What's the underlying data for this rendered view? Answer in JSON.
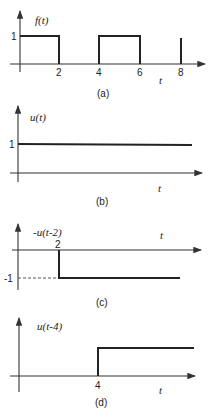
{
  "panels": [
    {
      "id": "a",
      "caption": "(a)",
      "ylabel": "f(t)",
      "xlabel": "t",
      "ytick": "1",
      "xticks": [
        "2",
        "4",
        "6",
        "8"
      ],
      "description": "Rectangular pulses of height 1 from t=0 to 2 and t=4 to 6, plus a vertical line at t=8"
    },
    {
      "id": "b",
      "caption": "(b)",
      "ylabel": "u(t)",
      "xlabel": "t",
      "ytick": "1",
      "description": "Unit step: constant 1 for t>=0"
    },
    {
      "id": "c",
      "caption": "(c)",
      "ylabel": "-u(t-2)",
      "xlabel": "t",
      "ytick": "-1",
      "xticks": [
        "2"
      ],
      "description": "Negative step of -1 starting at t=2; dashed line to y-axis at -1"
    },
    {
      "id": "d",
      "caption": "(d)",
      "ylabel": "u(t-4)",
      "xlabel": "t",
      "xticks": [
        "4"
      ],
      "description": "Unit step delayed to t=4"
    }
  ]
}
